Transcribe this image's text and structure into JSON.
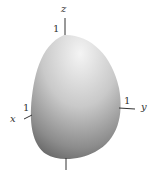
{
  "diagram": {
    "type": "3d-surface",
    "axes": {
      "z": {
        "label": "z",
        "tick_label": "1"
      },
      "x": {
        "label": "x",
        "tick_label": "1"
      },
      "y": {
        "label": "y",
        "tick_label": "1"
      }
    },
    "colors": {
      "surface_light": "#f2f2f2",
      "surface_mid": "#b8b8b8",
      "surface_dark": "#6e6e6e",
      "axis": "#333333",
      "background": "#ffffff"
    }
  }
}
